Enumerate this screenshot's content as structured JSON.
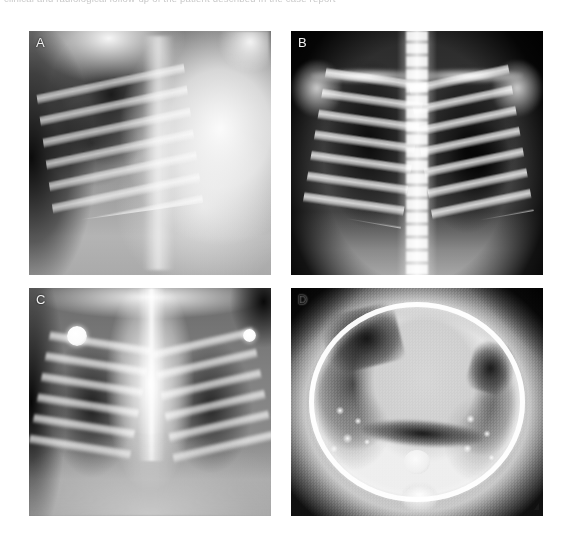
{
  "figure": {
    "caption_clipped": "clinical and radiological follow-up of the patient described in the case report",
    "background_color": "#ffffff",
    "layout": "2x2 panel grid",
    "panels": [
      {
        "id": "A",
        "label": "A",
        "label_color": "#f2f2f2",
        "modality": "Chest radiograph",
        "view": "Anteroposterior",
        "description": "Pediatric chest radiograph showing dense opacification of the right hemithorax with preserved aeration and visible posterior rib ladder on the left side.",
        "findings": "Right-sided near-complete opacification (whiteout); mediastinal shift; aerated left upper zone."
      },
      {
        "id": "B",
        "label": "B",
        "label_color": "#f2f2f2",
        "modality": "Chest radiograph",
        "view": "Posteroanterior",
        "description": "High-contrast chest radiograph with bright vertebral column, symmetric rib cage and bilaterally aerated lung fields.",
        "findings": "Re-expanded lungs; hyperlucent left lower zone; clavicles and scapulae well seen."
      },
      {
        "id": "C",
        "label": "C",
        "label_color": "#f2f2f2",
        "modality": "Chest radiograph",
        "view": "Anteroposterior",
        "description": "Follow-up chest radiograph with two radiopaque ECG monitoring electrodes projected over the chest wall.",
        "findings": "Widened central mediastinal/thymic shadow; bilateral aerated lungs; ECG electrodes overlying the upper chest."
      },
      {
        "id": "D",
        "label": "D",
        "label_color": "#1c1c1c",
        "modality": "Computed tomography",
        "view": "Axial, lung window",
        "description": "Axial chest CT in lung window demonstrating bilateral bronchiectasis with peribronchial thickening and patchy consolidation.",
        "findings": "Cystic and varicose bronchiectasis bilaterally; tree-in-bud opacities; central mediastinal soft tissue; descending aorta and vertebral body at posterior midline."
      }
    ]
  }
}
